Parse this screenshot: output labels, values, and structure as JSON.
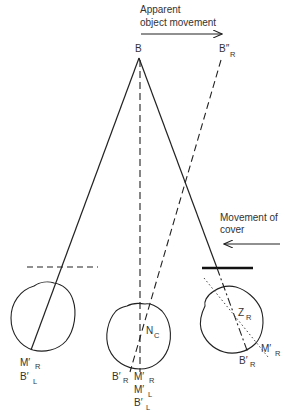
{
  "annotations": {
    "apparent_movement": [
      "Apparent",
      "object movement"
    ],
    "cover_movement": [
      "Movement of",
      "cover"
    ]
  },
  "points": {
    "B": {
      "main": "B",
      "sub": ""
    },
    "B_double_prime_R": {
      "main": "B″",
      "sub": "R"
    }
  },
  "left_eye": {
    "labels": [
      {
        "main": "M′",
        "sub": "R"
      },
      {
        "main": "B′",
        "sub": "L"
      }
    ]
  },
  "center_eye": {
    "inner_label": {
      "main": "N",
      "sub": "C"
    },
    "labels": [
      {
        "main": "B′",
        "sub": "R"
      },
      {
        "main": "M′",
        "sub": "R"
      },
      {
        "main": "M′",
        "sub": "L"
      },
      {
        "main": "B′",
        "sub": "L"
      }
    ]
  },
  "right_eye": {
    "inner_label": {
      "main": "Z",
      "sub": "R"
    },
    "labels": [
      {
        "main": "M′",
        "sub": "R"
      },
      {
        "main": "B′",
        "sub": "R"
      }
    ]
  },
  "colors": {
    "line": "#222222",
    "text": "#333333",
    "background": "#ffffff"
  }
}
